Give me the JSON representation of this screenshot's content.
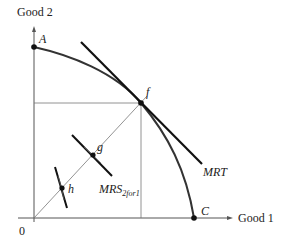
{
  "diagram": {
    "axes": {
      "y_label": "Good 2",
      "x_label": "Good 1",
      "origin_label": "0"
    },
    "points": {
      "A": "A",
      "f": "f",
      "g": "g",
      "h": "h",
      "C": "C"
    },
    "curves": {
      "frontier": "production possibility frontier A–f–C",
      "mrt_label": "MRT",
      "mrs_label_main": "MRS",
      "mrs_label_sub": "2for1"
    },
    "colors": {
      "curve": "#333333",
      "line": "#111111",
      "thin": "#666666"
    }
  }
}
